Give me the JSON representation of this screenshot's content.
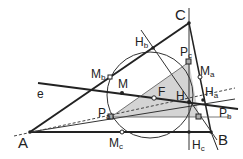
{
  "diagram": {
    "vertices": {
      "A": "A",
      "B": "B",
      "C": "C"
    },
    "points": {
      "H": "H",
      "M": "M",
      "F": "F",
      "e": "e",
      "Ha": {
        "base": "H",
        "sub": "a"
      },
      "Hb": {
        "base": "H",
        "sub": "b"
      },
      "Hc": {
        "base": "H",
        "sub": "c"
      },
      "Ma": {
        "base": "M",
        "sub": "a"
      },
      "Mb": {
        "base": "M",
        "sub": "b"
      },
      "Mc": {
        "base": "M",
        "sub": "c"
      },
      "Pa": {
        "base": "P",
        "sub": "a"
      },
      "Pb": {
        "base": "P",
        "sub": "b"
      },
      "Pc": {
        "base": "P",
        "sub": "c"
      }
    },
    "colors": {
      "line": "#222222",
      "fill": "#d4d4d4",
      "dashed": "#444444"
    }
  }
}
